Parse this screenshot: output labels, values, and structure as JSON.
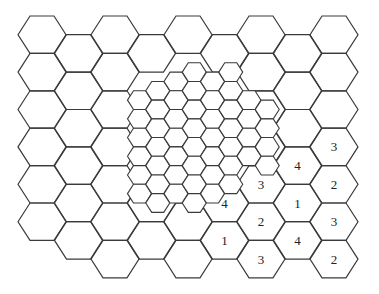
{
  "diagram": {
    "colors": {
      "stroke": "#3a3a3a",
      "background": "#ffffff",
      "label": "#222222"
    },
    "large_grid": {
      "origin_x": 18,
      "origin_y": 16,
      "col_spacing": 36.5,
      "hex_width": 48,
      "hex_height": 37.4,
      "cells": [
        {
          "col": 0,
          "rows": [
            0,
            1,
            2,
            3,
            4,
            5
          ]
        },
        {
          "col": 1,
          "rows": [
            0,
            1,
            2,
            3,
            4,
            5
          ]
        },
        {
          "col": 2,
          "rows": [
            0,
            1,
            2,
            3,
            4,
            5,
            6
          ]
        },
        {
          "col": 3,
          "rows": [
            0,
            4,
            5
          ]
        },
        {
          "col": 4,
          "rows": [
            0,
            4,
            5,
            6
          ]
        },
        {
          "col": 5,
          "rows": [
            0,
            4,
            5
          ]
        },
        {
          "col": 6,
          "rows": [
            0,
            1,
            2,
            3,
            4,
            5,
            6
          ]
        },
        {
          "col": 7,
          "rows": [
            0,
            1,
            2,
            3,
            4,
            5
          ]
        },
        {
          "col": 8,
          "rows": [
            0,
            1,
            2,
            3,
            4,
            5,
            6
          ]
        }
      ]
    },
    "small_grid": {
      "origin_x": 18,
      "origin_y": 16,
      "col_spacing": 18.25,
      "hex_width": 24,
      "hex_height": 18.7,
      "cells": [
        {
          "col": 6,
          "rows": [
            4,
            5,
            6,
            7,
            8,
            9
          ]
        },
        {
          "col": 7,
          "rows": [
            3,
            4,
            5,
            6,
            7,
            8,
            9
          ]
        },
        {
          "col": 8,
          "rows": [
            3,
            4,
            5,
            6,
            7,
            8,
            9
          ]
        },
        {
          "col": 9,
          "rows": [
            2,
            3,
            4,
            5,
            6,
            7,
            8,
            9
          ]
        },
        {
          "col": 10,
          "rows": [
            3,
            4,
            5,
            6,
            7,
            8,
            9
          ]
        },
        {
          "col": 11,
          "rows": [
            2,
            3,
            4,
            5,
            6,
            7,
            8
          ]
        },
        {
          "col": 12,
          "rows": [
            4,
            5,
            6,
            7
          ]
        },
        {
          "col": 13,
          "rows": [
            4,
            5,
            6,
            7
          ]
        }
      ]
    },
    "labels": [
      {
        "col": 5,
        "row": 4,
        "text": "4"
      },
      {
        "col": 5,
        "row": 5,
        "text": "1"
      },
      {
        "col": 6,
        "row": 4,
        "text": "3"
      },
      {
        "col": 6,
        "row": 5,
        "text": "2"
      },
      {
        "col": 6,
        "row": 6,
        "text": "3"
      },
      {
        "col": 7,
        "row": 3,
        "text": "4"
      },
      {
        "col": 7,
        "row": 4,
        "text": "1"
      },
      {
        "col": 7,
        "row": 5,
        "text": "4"
      },
      {
        "col": 8,
        "row": 3,
        "text": "3"
      },
      {
        "col": 8,
        "row": 4,
        "text": "2"
      },
      {
        "col": 8,
        "row": 5,
        "text": "3"
      },
      {
        "col": 8,
        "row": 6,
        "text": "2"
      }
    ]
  }
}
